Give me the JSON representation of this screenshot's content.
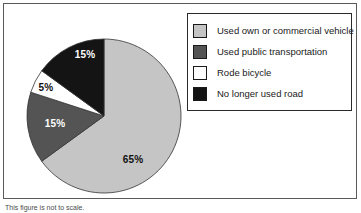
{
  "figure": {
    "caption": "This figure is not to scale."
  },
  "chart_data": {
    "type": "pie",
    "title": "",
    "categories": [
      "Used own or commercial vehicle",
      "Used public transportation",
      "Rode bicycle",
      "No longer used road"
    ],
    "values": [
      65,
      15,
      5,
      15
    ],
    "unit": "%",
    "labels": [
      "65%",
      "15%",
      "5%",
      "15%"
    ],
    "colors": [
      "#c5c5c5",
      "#545454",
      "#ffffff",
      "#141414"
    ],
    "label_text_colors": [
      "#111111",
      "#ffffff",
      "#111111",
      "#ffffff"
    ],
    "start_angle_deg": 0,
    "direction": "clockwise",
    "legend_position": "right",
    "outline_color": "#333333"
  },
  "legend": {
    "items": [
      {
        "label": "Used own or commercial vehicle",
        "swatch_color": "#c5c5c5"
      },
      {
        "label": "Used public transportation",
        "swatch_color": "#545454"
      },
      {
        "label": "Rode bicycle",
        "swatch_color": "#ffffff"
      },
      {
        "label": "No longer used road",
        "swatch_color": "#141414"
      }
    ]
  }
}
